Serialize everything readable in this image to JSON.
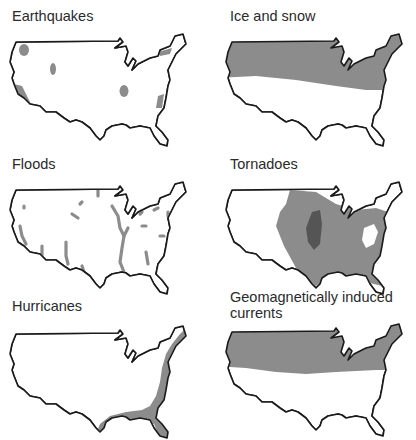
{
  "panels": [
    {
      "id": "earthquakes",
      "title": "Earthquakes"
    },
    {
      "id": "ice-and-snow",
      "title": "Ice and snow"
    },
    {
      "id": "floods",
      "title": "Floods"
    },
    {
      "id": "tornadoes",
      "title": "Tornadoes"
    },
    {
      "id": "hurricanes",
      "title": "Hurricanes"
    },
    {
      "id": "geomagnetically-induced-currents",
      "title": "Geomagnetically induced currents",
      "title_line1": "Geomagnetically induced",
      "title_line2": "currents"
    }
  ],
  "colors": {
    "outline": "#1a1a1a",
    "land": "#ffffff",
    "hazard": "#8c8c8c",
    "hazard_dark": "#555555"
  }
}
